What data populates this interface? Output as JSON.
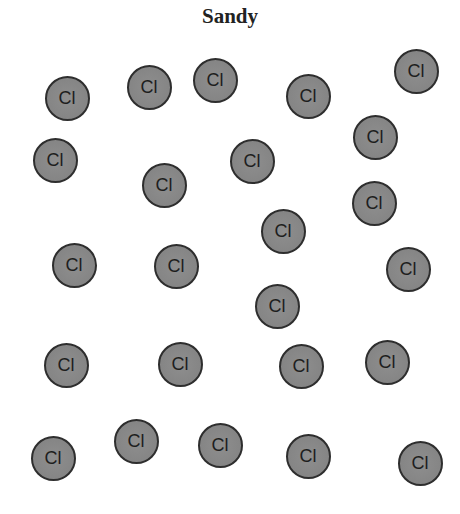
{
  "title": "Sandy",
  "particle_label": "Cl",
  "colors": {
    "fill": "#858585",
    "stroke": "#2e2e2e",
    "text": "#1e1e1e"
  },
  "particles": [
    {
      "x": 67,
      "y": 98,
      "label": "Cl"
    },
    {
      "x": 149,
      "y": 87,
      "label": "Cl"
    },
    {
      "x": 215,
      "y": 80,
      "label": "Cl"
    },
    {
      "x": 308,
      "y": 96,
      "label": "Cl"
    },
    {
      "x": 416,
      "y": 71,
      "label": "Cl"
    },
    {
      "x": 55,
      "y": 160,
      "label": "Cl"
    },
    {
      "x": 164,
      "y": 185,
      "label": "Cl"
    },
    {
      "x": 252,
      "y": 161,
      "label": "Cl"
    },
    {
      "x": 375,
      "y": 137,
      "label": "Cl"
    },
    {
      "x": 374,
      "y": 203,
      "label": "Cl"
    },
    {
      "x": 74,
      "y": 265,
      "label": "Cl"
    },
    {
      "x": 176,
      "y": 266,
      "label": "Cl"
    },
    {
      "x": 283,
      "y": 231,
      "label": "Cl"
    },
    {
      "x": 408,
      "y": 269,
      "label": "Cl"
    },
    {
      "x": 277,
      "y": 306,
      "label": "Cl"
    },
    {
      "x": 66,
      "y": 365,
      "label": "Cl"
    },
    {
      "x": 180,
      "y": 364,
      "label": "Cl"
    },
    {
      "x": 301,
      "y": 366,
      "label": "Cl"
    },
    {
      "x": 387,
      "y": 362,
      "label": "Cl"
    },
    {
      "x": 53,
      "y": 458,
      "label": "Cl"
    },
    {
      "x": 136,
      "y": 441,
      "label": "Cl"
    },
    {
      "x": 220,
      "y": 445,
      "label": "Cl"
    },
    {
      "x": 308,
      "y": 456,
      "label": "Cl"
    },
    {
      "x": 420,
      "y": 463,
      "label": "Cl"
    }
  ]
}
